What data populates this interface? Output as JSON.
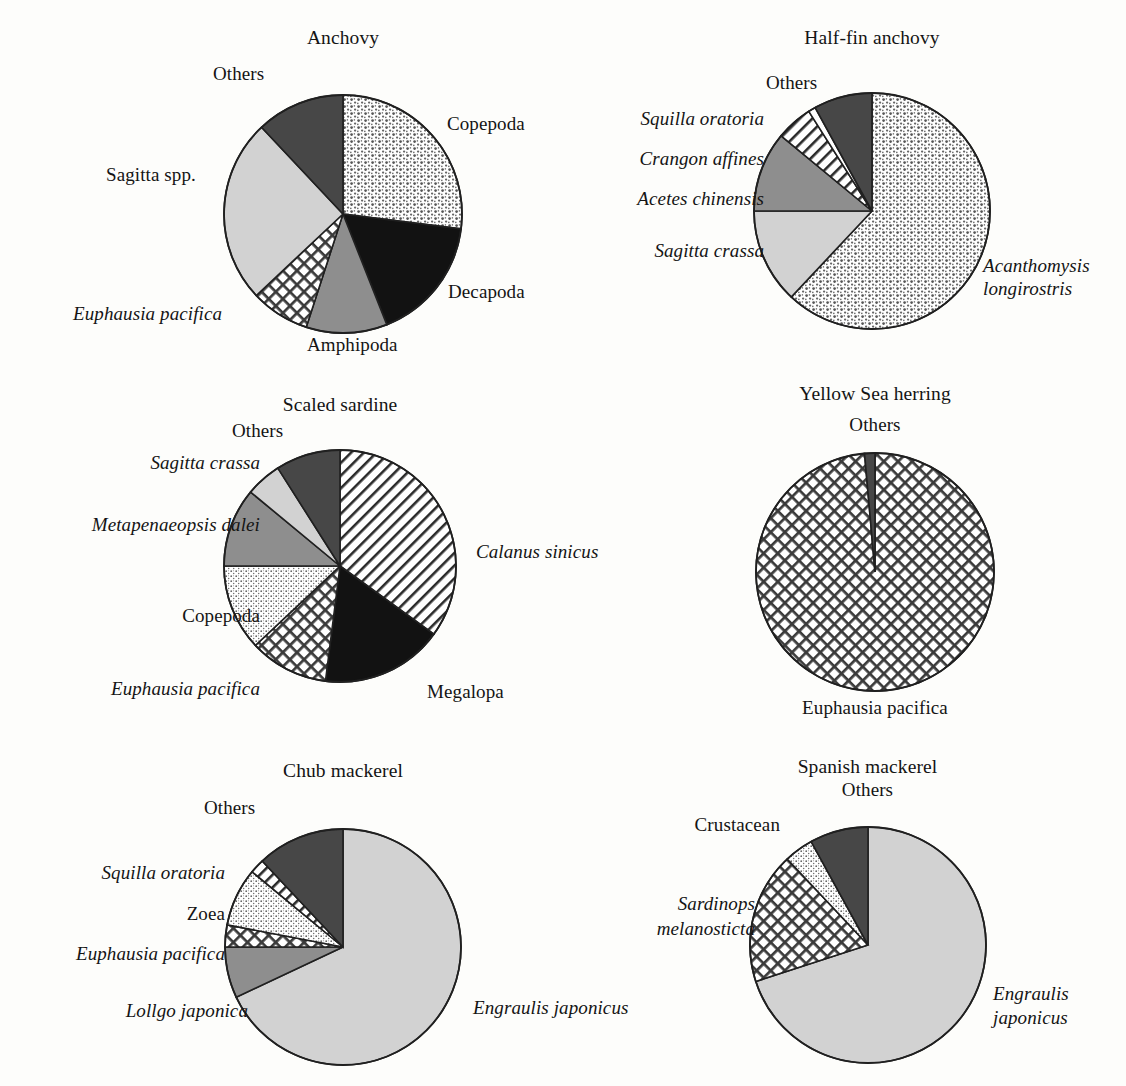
{
  "figure": {
    "background": "#fdfdfb",
    "outline_color": "#202020"
  },
  "chart_data": [
    {
      "type": "pie",
      "title": "Anchovy",
      "start_angle": 0,
      "center": [
        343,
        214
      ],
      "radius": 119,
      "slices": [
        {
          "label": "Copepoda",
          "value": 27,
          "fill": "dots-coarse",
          "italic": false
        },
        {
          "label": "Decapoda",
          "value": 17,
          "fill": "black",
          "italic": false
        },
        {
          "label": "Amphipoda",
          "value": 11,
          "fill": "gray-mid",
          "italic": false
        },
        {
          "label": "Euphausia pacifica",
          "value": 8,
          "fill": "crosshatch",
          "italic": true
        },
        {
          "label": "Sagitta spp.",
          "value": 25,
          "fill": "gray-light",
          "italic": true
        },
        {
          "label": "Others",
          "value": 12,
          "fill": "gray-dark",
          "italic": false
        }
      ]
    },
    {
      "type": "pie",
      "title": "Half-fin anchovy",
      "start_angle": 0,
      "center": [
        872,
        211
      ],
      "radius": 118,
      "slices": [
        {
          "label": "Acanthomysis\nlongirostris",
          "value": 62,
          "fill": "dots-coarse",
          "italic": true
        },
        {
          "label": "Sagitta crassa",
          "value": 13,
          "fill": "gray-light",
          "italic": true
        },
        {
          "label": "Acetes chinensis",
          "value": 11,
          "fill": "gray-mid",
          "italic": true
        },
        {
          "label": "Crangon affines",
          "value": 5,
          "fill": "diagonal",
          "italic": true
        },
        {
          "label": "Squilla oratoria",
          "value": 1,
          "fill": "white",
          "italic": true
        },
        {
          "label": "Others",
          "value": 8,
          "fill": "gray-dark",
          "italic": false
        }
      ]
    },
    {
      "type": "pie",
      "title": "Scaled sardine",
      "start_angle": 0,
      "center": [
        340,
        566
      ],
      "radius": 116,
      "slices": [
        {
          "label": "Calanus sinicus",
          "value": 35,
          "fill": "diagonal",
          "italic": true
        },
        {
          "label": "Megalopa",
          "value": 17,
          "fill": "black",
          "italic": false
        },
        {
          "label": "Euphausia pacifica",
          "value": 11,
          "fill": "crosshatch",
          "italic": true
        },
        {
          "label": "Copepoda",
          "value": 12,
          "fill": "dots-fine",
          "italic": false
        },
        {
          "label": "Metapenaeopsis dalei",
          "value": 11,
          "fill": "gray-mid",
          "italic": true
        },
        {
          "label": "Sagitta crassa",
          "value": 5,
          "fill": "gray-light",
          "italic": true
        },
        {
          "label": "Others",
          "value": 9,
          "fill": "gray-dark",
          "italic": false
        }
      ]
    },
    {
      "type": "pie",
      "title": "Yellow Sea herring",
      "start_angle": 0,
      "center": [
        875,
        572
      ],
      "radius": 119,
      "slices": [
        {
          "label": "Euphausia pacifica",
          "value": 98.6,
          "fill": "crosshatch",
          "italic": false
        },
        {
          "label": "Others",
          "value": 1.4,
          "fill": "gray-dark",
          "italic": false
        }
      ]
    },
    {
      "type": "pie",
      "title": "Chub mackerel",
      "start_angle": 0,
      "center": [
        343,
        947
      ],
      "radius": 118,
      "slices": [
        {
          "label": "Engraulis japonicus",
          "value": 68,
          "fill": "gray-light",
          "italic": true
        },
        {
          "label": "Lollgo japonica",
          "value": 7,
          "fill": "gray-mid",
          "italic": true
        },
        {
          "label": "Euphausia pacifica",
          "value": 3,
          "fill": "crosshatch",
          "italic": true
        },
        {
          "label": "Zoea",
          "value": 8,
          "fill": "dots-fine",
          "italic": false
        },
        {
          "label": "Squilla oratoria",
          "value": 2,
          "fill": "diagonal",
          "italic": true
        },
        {
          "label": "Others",
          "value": 12,
          "fill": "gray-dark",
          "italic": false
        }
      ]
    },
    {
      "type": "pie",
      "title": "Spanish mackerel",
      "start_angle": 0,
      "center": [
        868,
        945
      ],
      "radius": 118,
      "slices": [
        {
          "label": "Engraulis\njaponicus",
          "value": 70,
          "fill": "gray-light",
          "italic": true
        },
        {
          "label": "Sardinops\nmelanosticta",
          "value": 18,
          "fill": "crosshatch",
          "italic": true
        },
        {
          "label": "Crustacean",
          "value": 4,
          "fill": "dots-fine",
          "italic": false
        },
        {
          "label": "Others",
          "value": 8,
          "fill": "gray-dark",
          "italic": false
        }
      ]
    }
  ],
  "labels": {
    "anchovy": {
      "title": "Anchovy",
      "others": "Others",
      "copepoda": "Copepoda",
      "decapoda": "Decapoda",
      "amphipoda": "Amphipoda",
      "euphausia_pacifica": "Euphausia pacifica",
      "sagitta_genus": "Sagitta",
      "sagitta_spp": " spp."
    },
    "halffin": {
      "title": "Half-fin anchovy",
      "others": "Others",
      "squilla_oratoria": "Squilla oratoria",
      "crangon_affines": "Crangon affines",
      "acetes_chinensis": "Acetes chinensis",
      "sagitta_crassa": "Sagitta crassa",
      "acanthomysis_1": "Acanthomysis",
      "acanthomysis_2": "longirostris"
    },
    "sardine": {
      "title": "Scaled sardine",
      "others": "Others",
      "sagitta_crassa": "Sagitta crassa",
      "metapenaeopsis_dalei": "Metapenaeopsis dalei",
      "copepoda": "Copepoda",
      "euphausia_pacifica": "Euphausia pacifica",
      "calanus_sinicus": "Calanus sinicus",
      "megalopa": "Megalopa"
    },
    "herring": {
      "title": "Yellow Sea herring",
      "others": "Others",
      "euphausia_pacifica": "Euphausia pacifica"
    },
    "chub": {
      "title": "Chub mackerel",
      "others": "Others",
      "squilla_oratoria": "Squilla oratoria",
      "zoea": "Zoea",
      "euphausia_pacifica": "Euphausia pacifica",
      "lollgo_japonica": "Lollgo japonica",
      "engraulis_japonicus": "Engraulis japonicus"
    },
    "spanish": {
      "title": "Spanish mackerel",
      "others": "Others",
      "crustacean": "Crustacean",
      "sardinops_1": "Sardinops",
      "sardinops_2": "melanosticta",
      "engraulis_1": "Engraulis",
      "engraulis_2": "japonicus"
    }
  }
}
